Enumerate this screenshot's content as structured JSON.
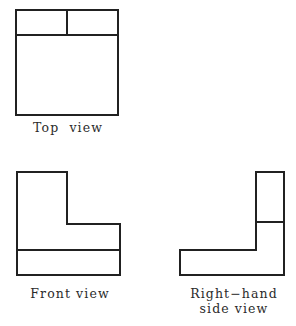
{
  "drawing": {
    "title_text": "",
    "line_color": "#212121",
    "fill_color": "#ffffff",
    "background_color": "#ffffff",
    "line_width": 2,
    "views": [
      {
        "id": "top-view",
        "label": "Top  view",
        "shape": "rectangle-with-divided-upper-band",
        "outline_points": "16,10 118,10 118,115 16,115",
        "internal_edges": [
          {
            "name": "horizontal-band-divider",
            "x1": 16,
            "y1": 35,
            "x2": 118,
            "y2": 35
          },
          {
            "name": "vertical-band-divider",
            "x1": 67,
            "y1": 10,
            "x2": 67,
            "y2": 35
          }
        ]
      },
      {
        "id": "front-view",
        "label": "Front view",
        "shape": "L-shape-opening-right",
        "outline_points": "17,172 67,172 67,224 120,224 120,275 17,275",
        "internal_edges": [
          {
            "name": "base-divider-line",
            "x1": 17,
            "y1": 250,
            "x2": 120,
            "y2": 250
          }
        ]
      },
      {
        "id": "right-hand-side-view",
        "label": "Right−hand\nside view",
        "shape": "L-shape-opening-left",
        "outline_points": "256,172 284,172 284,275 180,275 180,250 256,250",
        "internal_edges": [
          {
            "name": "leg-divider-line",
            "x1": 256,
            "y1": 222,
            "x2": 284,
            "y2": 222
          }
        ]
      }
    ]
  },
  "labels": {
    "top_view": "Top  view",
    "front_view": "Front view",
    "side_view_line1": "Right−hand",
    "side_view_line2": "side view"
  }
}
